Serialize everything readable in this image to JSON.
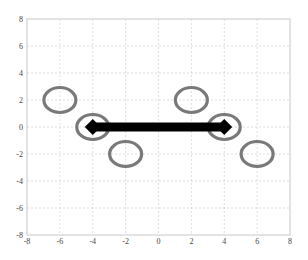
{
  "chart_data": {
    "type": "scatter",
    "title": "",
    "xlabel": "",
    "ylabel": "",
    "xlim": [
      -8,
      8
    ],
    "ylim": [
      -8,
      8
    ],
    "grid": true,
    "grid_style": "dashed",
    "x_ticks": [
      -8,
      -6,
      -4,
      -2,
      0,
      2,
      4,
      6,
      8
    ],
    "y_ticks": [
      -8,
      -6,
      -4,
      -2,
      0,
      2,
      4,
      6,
      8
    ],
    "x_tick_labels": [
      "-8",
      "-6",
      "-4",
      "-2",
      "0",
      "2",
      "4",
      "6",
      "8"
    ],
    "y_tick_labels": [
      "-8",
      "-6",
      "-4",
      "-2",
      "0",
      "2",
      "4",
      "6",
      "8"
    ],
    "legend": null,
    "series": [
      {
        "name": "ellipses",
        "marker": "open-ellipse",
        "color": "#6a6a6a",
        "points": [
          {
            "x": -6,
            "y": 2
          },
          {
            "x": -4,
            "y": 0
          },
          {
            "x": -2,
            "y": -2
          },
          {
            "x": 2,
            "y": 2
          },
          {
            "x": 4,
            "y": 0
          },
          {
            "x": 6,
            "y": -2
          }
        ]
      },
      {
        "name": "segment",
        "type": "line",
        "marker": "diamond",
        "color": "#000000",
        "line_width": "thick",
        "points": [
          {
            "x": -4,
            "y": 0
          },
          {
            "x": 4,
            "y": 0
          }
        ]
      }
    ]
  },
  "colors": {
    "background": "#ffffff",
    "grid": "#d4d4d4",
    "axis": "#c8c8c8",
    "ellipse": "#6a6a6a",
    "segment": "#000000",
    "tick_text": "#444444"
  }
}
